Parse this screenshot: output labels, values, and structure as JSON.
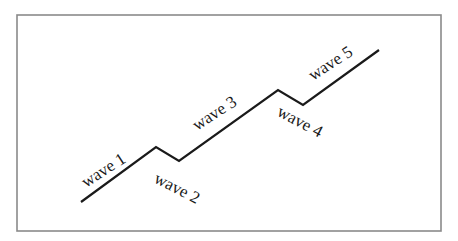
{
  "diagram": {
    "title": "",
    "frame": {
      "x": 17,
      "y": 15,
      "width": 424,
      "height": 216,
      "stroke": "#8a8a8a"
    },
    "line_color": "#1a1a1a",
    "points": [
      {
        "x": 81,
        "y": 202
      },
      {
        "x": 156,
        "y": 147
      },
      {
        "x": 179,
        "y": 161
      },
      {
        "x": 278,
        "y": 90
      },
      {
        "x": 303,
        "y": 105
      },
      {
        "x": 379,
        "y": 50
      }
    ],
    "labels": [
      {
        "text": "wave 1",
        "x": 86,
        "y": 188,
        "rotate": -33
      },
      {
        "text": "wave 2",
        "x": 153,
        "y": 182,
        "rotate": 27
      },
      {
        "text": "wave 3",
        "x": 197,
        "y": 131,
        "rotate": -33
      },
      {
        "text": "wave 4",
        "x": 276,
        "y": 115,
        "rotate": 28
      },
      {
        "text": "wave 5",
        "x": 313,
        "y": 81,
        "rotate": -33
      }
    ]
  }
}
